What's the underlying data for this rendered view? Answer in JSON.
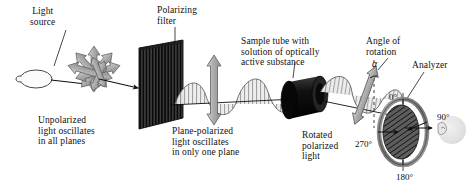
{
  "diagram": {
    "background_color": "#ffffff",
    "ink_color": "#101010",
    "gray_arrow_fill": "#b8b8b8",
    "gray_arrow_stroke": "#5a5a5a",
    "filter_color": "#2b2b2b",
    "tube_color": "#141414",
    "ring_color": "#8c8c8c",
    "eye_color": "#d8d8d8"
  },
  "labels": {
    "light_source": "Light\nsource",
    "polarizing_filter": "Polarizing\nfilter",
    "sample_tube": "Sample tube with\nsolution of optically\nactive substance",
    "angle_of_rotation": "Angle of\nrotation",
    "analyzer": "Analyzer",
    "unpolarized": "Unpolarized\nlight oscillates\nin all planes",
    "plane_polarized": "Plane-polarized\nlight oscillates\nin only one plane",
    "rotated_polarized": "Rotated\npolarized\nlight",
    "alpha_symbol": "α"
  },
  "analyzer_dial": {
    "degree_0": "0°",
    "degree_90": "90°",
    "degree_180": "180°",
    "degree_270": "270°"
  },
  "components": [
    {
      "name": "light-source-bulb",
      "kind": "lamp"
    },
    {
      "name": "unpolarized-starburst",
      "kind": "multi-arrow"
    },
    {
      "name": "polarizing-filter",
      "kind": "striped-panel"
    },
    {
      "name": "plane-polarized-wave",
      "kind": "sine-wave"
    },
    {
      "name": "vertical-oscillation-arrow",
      "kind": "double-arrow"
    },
    {
      "name": "sample-tube",
      "kind": "cylinder"
    },
    {
      "name": "rotated-wave",
      "kind": "sine-wave"
    },
    {
      "name": "rotation-angle-marker",
      "kind": "angle"
    },
    {
      "name": "analyzer-dial",
      "kind": "dial"
    },
    {
      "name": "observer-eye",
      "kind": "eye"
    }
  ]
}
